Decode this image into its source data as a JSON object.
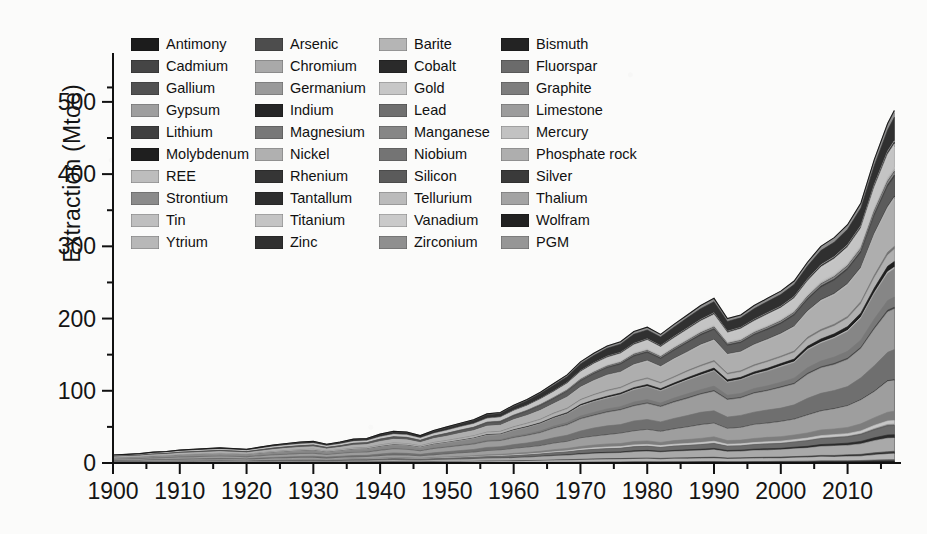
{
  "chart_data": {
    "type": "area",
    "stacked": true,
    "title": "",
    "xlabel": "",
    "ylabel": "Extraction (Mtoe)",
    "xlim": [
      1900,
      2018
    ],
    "ylim": [
      0,
      540
    ],
    "yticks": [
      0,
      100,
      200,
      300,
      400,
      500
    ],
    "ytick_labels": [
      "0",
      "100",
      "200",
      "300",
      "400",
      "500"
    ],
    "y_minor_ticks": [
      50,
      150,
      250,
      350,
      450,
      520
    ],
    "xticks": [
      1900,
      1910,
      1920,
      1930,
      1940,
      1950,
      1960,
      1970,
      1980,
      1990,
      2000,
      2010
    ],
    "xtick_labels": [
      "1900",
      "1910",
      "1920",
      "1930",
      "1940",
      "1950",
      "1960",
      "1970",
      "1980",
      "1990",
      "2000",
      "2010"
    ],
    "x_minor_ticks": [
      1905,
      1915,
      1925,
      1935,
      1945,
      1955,
      1965,
      1975,
      1985,
      1995,
      2005,
      2015
    ],
    "grid": false,
    "legend_position": "top-left-inside",
    "legend_columns": 4,
    "x": [
      1900,
      1902,
      1904,
      1906,
      1908,
      1910,
      1912,
      1914,
      1916,
      1918,
      1920,
      1922,
      1924,
      1926,
      1928,
      1930,
      1932,
      1934,
      1936,
      1938,
      1940,
      1942,
      1944,
      1946,
      1948,
      1950,
      1952,
      1954,
      1956,
      1958,
      1960,
      1962,
      1964,
      1966,
      1968,
      1970,
      1972,
      1974,
      1976,
      1978,
      1980,
      1982,
      1984,
      1986,
      1988,
      1990,
      1992,
      1994,
      1996,
      1998,
      2000,
      2002,
      2004,
      2006,
      2008,
      2010,
      2012,
      2014,
      2016,
      2017
    ],
    "total_values": [
      11,
      12,
      13,
      15,
      16,
      18,
      19,
      20,
      21,
      20,
      19,
      22,
      25,
      27,
      29,
      30,
      26,
      29,
      33,
      34,
      40,
      44,
      43,
      38,
      45,
      50,
      55,
      60,
      68,
      70,
      80,
      88,
      98,
      110,
      122,
      140,
      152,
      162,
      168,
      182,
      188,
      178,
      192,
      205,
      218,
      228,
      200,
      205,
      218,
      228,
      238,
      252,
      278,
      300,
      312,
      330,
      360,
      420,
      470,
      488
    ],
    "series": [
      {
        "name": "Antimony",
        "color": "#1c1c1c",
        "share": 0.004
      },
      {
        "name": "Arsenic",
        "color": "#4d4d4d",
        "share": 0.003
      },
      {
        "name": "Barite",
        "color": "#b5b5b5",
        "share": 0.018
      },
      {
        "name": "Bismuth",
        "color": "#232323",
        "share": 0.002
      },
      {
        "name": "Cadmium",
        "color": "#454545",
        "share": 0.003
      },
      {
        "name": "Chromium",
        "color": "#a9a9a9",
        "share": 0.04
      },
      {
        "name": "Cobalt",
        "color": "#2a2a2a",
        "share": 0.006
      },
      {
        "name": "Fluorspar",
        "color": "#6b6b6b",
        "share": 0.022
      },
      {
        "name": "Gallium",
        "color": "#515151",
        "share": 0.002
      },
      {
        "name": "Germanium",
        "color": "#9a9a9a",
        "share": 0.002
      },
      {
        "name": "Gold",
        "color": "#c7c7c7",
        "share": 0.01
      },
      {
        "name": "Graphite",
        "color": "#7d7d7d",
        "share": 0.02
      },
      {
        "name": "Gypsum",
        "color": "#9e9e9e",
        "share": 0.06
      },
      {
        "name": "Indium",
        "color": "#262626",
        "share": 0.002
      },
      {
        "name": "Lead",
        "color": "#6f6f6f",
        "share": 0.055
      },
      {
        "name": "Limestone",
        "color": "#9c9c9c",
        "share": 0.09
      },
      {
        "name": "Lithium",
        "color": "#404040",
        "share": 0.005
      },
      {
        "name": "Magnesium",
        "color": "#787878",
        "share": 0.018
      },
      {
        "name": "Manganese",
        "color": "#868686",
        "share": 0.075
      },
      {
        "name": "Mercury",
        "color": "#c2c2c2",
        "share": 0.004
      },
      {
        "name": "Molybdenum",
        "color": "#1f1f1f",
        "share": 0.01
      },
      {
        "name": "Nickel",
        "color": "#b0b0b0",
        "share": 0.035
      },
      {
        "name": "Niobium",
        "color": "#747474",
        "share": 0.006
      },
      {
        "name": "Phosphate rock",
        "color": "#aeaeae",
        "share": 0.09
      },
      {
        "name": "REE",
        "color": "#bdbdbd",
        "share": 0.006
      },
      {
        "name": "Rhenium",
        "color": "#353535",
        "share": 0.002
      },
      {
        "name": "Silicon",
        "color": "#5b5b5b",
        "share": 0.045
      },
      {
        "name": "Silver",
        "color": "#3a3a3a",
        "share": 0.006
      },
      {
        "name": "Strontium",
        "color": "#8b8b8b",
        "share": 0.005
      },
      {
        "name": "Tantallum",
        "color": "#2e2e2e",
        "share": 0.002
      },
      {
        "name": "Tellurium",
        "color": "#bbbbbb",
        "share": 0.002
      },
      {
        "name": "Thalium",
        "color": "#a3a3a3",
        "share": 0.002
      },
      {
        "name": "Tin",
        "color": "#bfbfbf",
        "share": 0.008
      },
      {
        "name": "Titanium",
        "color": "#c4c4c4",
        "share": 0.04
      },
      {
        "name": "Vanadium",
        "color": "#cacaca",
        "share": 0.006
      },
      {
        "name": "Wolfram",
        "color": "#212121",
        "share": 0.006
      },
      {
        "name": "Ytrium",
        "color": "#b8b8b8",
        "share": 0.002
      },
      {
        "name": "Zinc",
        "color": "#303030",
        "share": 0.055
      },
      {
        "name": "Zirconium",
        "color": "#8f8f8f",
        "share": 0.012
      },
      {
        "name": "PGM",
        "color": "#969696",
        "share": 0.004
      }
    ]
  },
  "legend": {
    "columns": [
      [
        {
          "label": "Antimony",
          "color": "#1c1c1c"
        },
        {
          "label": "Cadmium",
          "color": "#454545"
        },
        {
          "label": "Gallium",
          "color": "#515151"
        },
        {
          "label": "Gypsum",
          "color": "#9e9e9e"
        },
        {
          "label": "Lithium",
          "color": "#404040"
        },
        {
          "label": "Molybdenum",
          "color": "#1f1f1f"
        },
        {
          "label": "REE",
          "color": "#bdbdbd"
        },
        {
          "label": "Strontium",
          "color": "#8b8b8b"
        },
        {
          "label": "Tin",
          "color": "#bfbfbf"
        },
        {
          "label": "Ytrium",
          "color": "#b8b8b8"
        }
      ],
      [
        {
          "label": "Arsenic",
          "color": "#4d4d4d"
        },
        {
          "label": "Chromium",
          "color": "#a9a9a9"
        },
        {
          "label": "Germanium",
          "color": "#9a9a9a"
        },
        {
          "label": "Indium",
          "color": "#262626"
        },
        {
          "label": "Magnesium",
          "color": "#787878"
        },
        {
          "label": "Nickel",
          "color": "#b0b0b0"
        },
        {
          "label": "Rhenium",
          "color": "#353535"
        },
        {
          "label": "Tantallum",
          "color": "#2e2e2e"
        },
        {
          "label": "Titanium",
          "color": "#c4c4c4"
        },
        {
          "label": "Zinc",
          "color": "#303030"
        }
      ],
      [
        {
          "label": "Barite",
          "color": "#b5b5b5"
        },
        {
          "label": "Cobalt",
          "color": "#2a2a2a"
        },
        {
          "label": "Gold",
          "color": "#c7c7c7"
        },
        {
          "label": "Lead",
          "color": "#6f6f6f"
        },
        {
          "label": "Manganese",
          "color": "#868686"
        },
        {
          "label": "Niobium",
          "color": "#747474"
        },
        {
          "label": "Silicon",
          "color": "#5b5b5b"
        },
        {
          "label": "Tellurium",
          "color": "#bbbbbb"
        },
        {
          "label": "Vanadium",
          "color": "#cacaca"
        },
        {
          "label": "Zirconium",
          "color": "#8f8f8f"
        }
      ],
      [
        {
          "label": "Bismuth",
          "color": "#232323"
        },
        {
          "label": "Fluorspar",
          "color": "#6b6b6b"
        },
        {
          "label": "Graphite",
          "color": "#7d7d7d"
        },
        {
          "label": "Limestone",
          "color": "#9c9c9c"
        },
        {
          "label": "Mercury",
          "color": "#c2c2c2"
        },
        {
          "label": "Phosphate rock",
          "color": "#aeaeae"
        },
        {
          "label": "Silver",
          "color": "#3a3a3a"
        },
        {
          "label": "Thalium",
          "color": "#a3a3a3"
        },
        {
          "label": "Wolfram",
          "color": "#212121"
        },
        {
          "label": "PGM",
          "color": "#969696"
        }
      ]
    ]
  }
}
